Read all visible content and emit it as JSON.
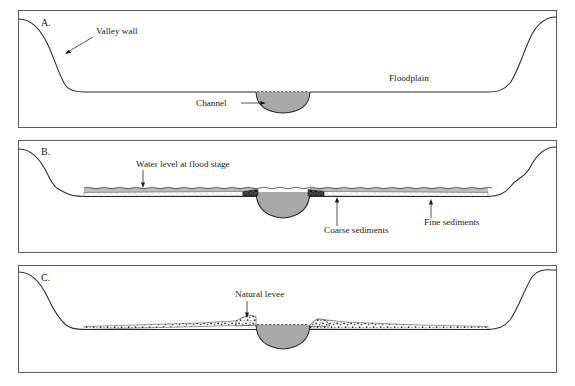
{
  "figure": {
    "panel_count": 3,
    "background_color": "#ffffff",
    "frame_color": "#4a4a4a",
    "ground_line_color": "#2a2a2a",
    "water_fill_color": "#a8a8a8",
    "flood_water_color": "#b4b4b4",
    "coarse_sediment_color": "#2e2e2e",
    "fine_sediment_color": "#6e6e6e"
  },
  "panels": [
    {
      "letter": "A.",
      "name": "pre-flood-valley-cross-section",
      "labels": [
        {
          "id": "valley-wall",
          "text": "Valley wall"
        },
        {
          "id": "channel",
          "text": "Channel"
        },
        {
          "id": "floodplain",
          "text": "Floodplain"
        }
      ]
    },
    {
      "letter": "B.",
      "name": "flood-stage-cross-section",
      "labels": [
        {
          "id": "water-level",
          "text": "Water level at flood stage"
        },
        {
          "id": "coarse-sediments",
          "text": "Coarse sediments"
        },
        {
          "id": "fine-sediments",
          "text": "Fine sediments"
        }
      ]
    },
    {
      "letter": "C.",
      "name": "post-flood-levee-cross-section",
      "labels": [
        {
          "id": "natural-levee",
          "text": "Natural levee"
        }
      ]
    }
  ]
}
